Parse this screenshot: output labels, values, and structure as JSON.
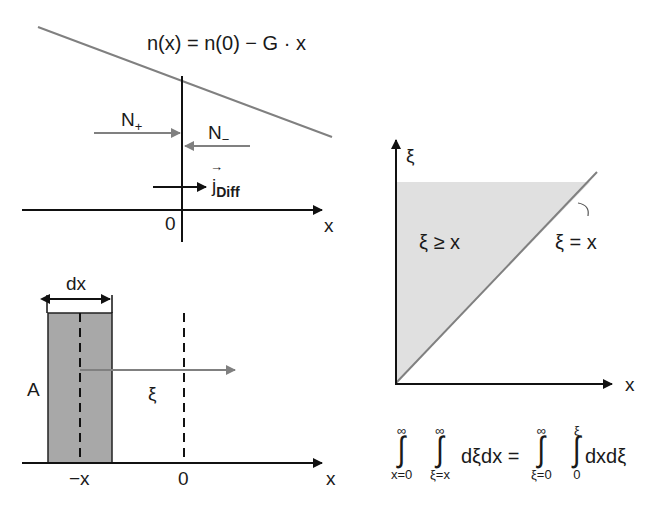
{
  "top_panel": {
    "equation": "n(x) = n(0) − G · x",
    "n_plus": "N",
    "n_plus_sub": "+",
    "n_minus": "N",
    "n_minus_sub": "−",
    "j_diff": "j",
    "j_diff_sub": "Diff",
    "vector_arrow": "→",
    "origin_label": "0",
    "axis_label": "x"
  },
  "bottom_panel": {
    "width_label": "dx",
    "area_label": "A",
    "xi_label": "ξ",
    "neg_x_label": "−x",
    "origin_label": "0",
    "axis_label": "x"
  },
  "right_panel": {
    "y_axis_label": "ξ",
    "x_axis_label": "x",
    "region_label": "ξ ≥ x",
    "line_label": "ξ = x"
  },
  "formula": {
    "int1_upper": "∞",
    "int1_lower": "x=0",
    "int2_upper": "∞",
    "int2_lower": "ξ=x",
    "lhs_integrand": "dξdx =",
    "int3_upper": "∞",
    "int3_lower": "ξ=0",
    "int4_upper": "ξ",
    "int4_lower": "0",
    "rhs_integrand": "dxdξ",
    "integral_sign": "∫"
  },
  "colors": {
    "line_gray": "#808080",
    "shade_dark": "#a8a8a8",
    "shade_light": "#e0e0e0",
    "axis": "#111111"
  }
}
